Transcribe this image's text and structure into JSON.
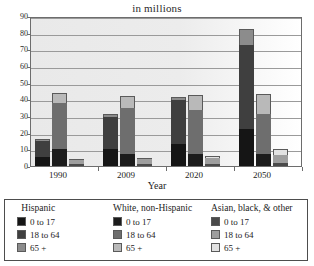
{
  "chart_data": {
    "type": "bar",
    "title": "in millions",
    "subtitle": "",
    "xlabel": "Year",
    "ylabel": "",
    "ylim": [
      0,
      90
    ],
    "ytick_step": 10,
    "yticks": [
      "0",
      "10",
      "20",
      "30",
      "40",
      "50",
      "60",
      "70",
      "80",
      "90"
    ],
    "grid": true,
    "stacked": true,
    "legend_position": "bottom",
    "categories": [
      "1990",
      "2009",
      "2020",
      "2050"
    ],
    "groups": [
      {
        "name": "Hispanic",
        "series": [
          {
            "name": "0 to 17",
            "color": "#151515",
            "values": [
              5.5,
              10.5,
              13.0,
              22.5
            ]
          },
          {
            "name": "18 to 64",
            "color": "#3f3f3f",
            "values": [
              9.5,
              19.0,
              26.5,
              50.0
            ]
          },
          {
            "name": "65 +",
            "color": "#8c8c8c",
            "values": [
              1.0,
              1.5,
              2.0,
              9.5
            ]
          }
        ],
        "totals": [
          16.0,
          31.0,
          41.5,
          82.0
        ]
      },
      {
        "name": "White, non-Hispanic",
        "series": [
          {
            "name": "0 to 17",
            "color": "#1c1c1c",
            "values": [
              10.0,
              7.5,
              7.0,
              7.5
            ]
          },
          {
            "name": "18 to 64",
            "color": "#6e6e6e",
            "values": [
              28.0,
              27.5,
              26.5,
              24.0
            ]
          },
          {
            "name": "65 +",
            "color": "#b9b9b9",
            "values": [
              6.0,
              7.0,
              9.0,
              11.5
            ]
          }
        ],
        "totals": [
          44.0,
          42.0,
          42.5,
          43.0
        ]
      },
      {
        "name": "Asian, black, & other",
        "series": [
          {
            "name": "0 to 17",
            "color": "#4a4a4a",
            "values": [
              1.0,
              1.5,
              1.5,
              2.0
            ]
          },
          {
            "name": "18 to 64",
            "color": "#9e9e9e",
            "values": [
              2.5,
              2.5,
              3.5,
              4.5
            ]
          },
          {
            "name": "65 +",
            "color": "#e2e2e2",
            "values": [
              0.5,
              0.5,
              1.0,
              3.5
            ]
          }
        ],
        "totals": [
          4.0,
          4.5,
          6.0,
          10.0
        ]
      }
    ]
  },
  "legend": {
    "groups": [
      {
        "title": "Hispanic",
        "items": [
          {
            "label": "0 to 17",
            "color": "#151515"
          },
          {
            "label": "18 to 64",
            "color": "#3f3f3f"
          },
          {
            "label": "65 +",
            "color": "#8c8c8c"
          }
        ]
      },
      {
        "title": "White, non-Hispanic",
        "items": [
          {
            "label": "0 to 17",
            "color": "#1c1c1c"
          },
          {
            "label": "18 to 64",
            "color": "#6e6e6e"
          },
          {
            "label": "65 +",
            "color": "#b9b9b9"
          }
        ]
      },
      {
        "title": "Asian, black, & other",
        "items": [
          {
            "label": "0 to 17",
            "color": "#4a4a4a"
          },
          {
            "label": "18 to 64",
            "color": "#9e9e9e"
          },
          {
            "label": "65 +",
            "color": "#e2e2e2"
          }
        ]
      }
    ]
  }
}
